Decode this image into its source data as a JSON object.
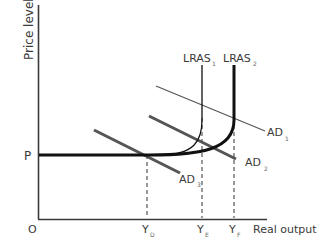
{
  "diagram": {
    "axes": {
      "y_label": "Price level",
      "x_label": "Real output",
      "origin_label": "O"
    },
    "price_label": "P",
    "output_labels": [
      {
        "main": "Y",
        "sub": "D"
      },
      {
        "main": "Y",
        "sub": "E"
      },
      {
        "main": "Y",
        "sub": "F"
      }
    ],
    "curves": {
      "lras1": {
        "main": "LRAS",
        "sub": "1"
      },
      "lras2": {
        "main": "LRAS",
        "sub": "2"
      },
      "ad1": {
        "main": "AD",
        "sub": "1"
      },
      "ad2": {
        "main": "AD",
        "sub": "2"
      },
      "ad3": {
        "main": "AD",
        "sub": "3"
      }
    },
    "colors": {
      "axis": "#3a3a3a",
      "lras": "#111111",
      "ad_thin": "#555555",
      "ad_thick": "#555555",
      "dashed": "#333333",
      "text": "#3a3a3a"
    }
  }
}
